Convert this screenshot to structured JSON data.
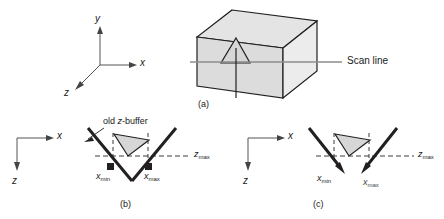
{
  "figure": {
    "title_visible": false,
    "panels": [
      {
        "id": "a",
        "caption": "(a)",
        "axes": {
          "x_label": "x",
          "y_label": "y",
          "z_label": "z"
        },
        "scan_line_label": "Scan line"
      },
      {
        "id": "b",
        "caption": "(b)",
        "axes": {
          "x_label": "x",
          "z_label": "z"
        },
        "annotation": "old z-buffer",
        "annotation_parts": {
          "pre": "old ",
          "italic": "z",
          "post": "-buffer"
        },
        "xmin_label": {
          "base": "x",
          "sub": "min"
        },
        "xmax_label": {
          "base": "x",
          "sub": "max"
        },
        "zmax_label": {
          "base": "z",
          "sub": "max"
        }
      },
      {
        "id": "c",
        "caption": "(c)",
        "axes": {
          "x_label": "x",
          "z_label": "z"
        },
        "xmin_label": {
          "base": "x",
          "sub": "min"
        },
        "xmax_label": {
          "base": "x",
          "sub": "max"
        },
        "zmax_label": {
          "base": "z",
          "sub": "max"
        }
      }
    ]
  },
  "colors": {
    "stroke": "#231f20",
    "line_gray": "#808080",
    "box_top_fill": "#e3e3e3",
    "box_left_fill": "#dadada",
    "box_right_fill": "#ebebeb",
    "triangle_fill": "#d9d9d9",
    "background": "#ffffff"
  }
}
